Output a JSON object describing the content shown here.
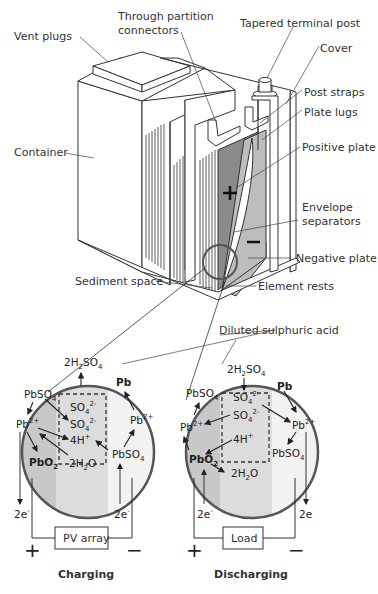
{
  "battery_labels": {
    "vent_plugs": "Vent plugs",
    "through_partition_1": "Through partition",
    "through_partition_2": "connectors",
    "tapered_terminal_post": "Tapered terminal post",
    "cover": "Cover",
    "post_straps": "Post straps",
    "plate_lugs": "Plate lugs",
    "positive_plate": "Positive plate",
    "container": "Container",
    "envelope_1": "Envelope",
    "envelope_2": "separators",
    "negative_plate": "Negative plate",
    "sediment_space": "Sediment space",
    "element_rests": "Element rests",
    "diluted_acid": "Diluted sulphuric acid",
    "plus_sign": "+",
    "minus_sign": "−"
  },
  "charging": {
    "caption": "Charging",
    "device": "PV array",
    "electron_left": "2e",
    "electron_right": "2e",
    "terminal_pos": "+",
    "terminal_neg": "−",
    "species": {
      "h2so4": "2H",
      "pbso4_left": "PbSO",
      "pb2_left": "Pb",
      "pbo2": "PbO",
      "h2o": "2H",
      "so4_a": "SO",
      "so4_b": "SO",
      "h4": "4H",
      "pb": "Pb",
      "pb2_right": "Pb",
      "pbso4_right": "PbSO"
    }
  },
  "discharging": {
    "caption": "Discharging",
    "device": "Load",
    "electron_left": "2e",
    "electron_right": "2e",
    "terminal_pos": "+",
    "terminal_neg": "−",
    "species": {
      "h2so4": "2H",
      "pbso4_left": "PbSO",
      "pb2_left": "Pb",
      "pbo2": "PbO",
      "h2o": "2H",
      "so4_a": "SO",
      "so4_b": "SO",
      "h4": "4H",
      "pb": "Pb",
      "pb2_right": "Pb",
      "pbso4_right": "PbSO"
    }
  },
  "colors": {
    "line": "#333333",
    "positive_plate": "#8a8a8a",
    "negative_plate": "#bdbdbd",
    "circle_left_zone": "#c8c8c8",
    "circle_mid_zone": "#dcdcdc",
    "circle_right_zone": "#f2f2f2",
    "circle_border": "#555555"
  }
}
